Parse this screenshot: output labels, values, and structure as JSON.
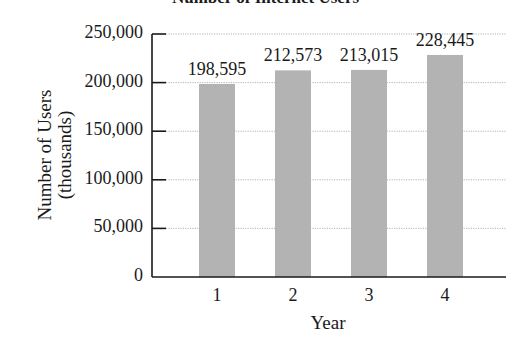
{
  "chart_data": {
    "type": "bar",
    "title": "Number of Internet Users",
    "xlabel": "Year",
    "ylabel": "Number of Users (thousands)",
    "ylabel_lines": [
      "Number of Users",
      "(thousands)"
    ],
    "categories": [
      "1",
      "2",
      "3",
      "4"
    ],
    "values": [
      198595,
      212573,
      213015,
      228445
    ],
    "value_labels": [
      "198,595",
      "212,573",
      "213,015",
      "228,445"
    ],
    "yticks": [
      0,
      50000,
      100000,
      150000,
      200000,
      250000
    ],
    "ytick_labels": [
      "0",
      "50,000",
      "100,000",
      "150,000",
      "200,000",
      "250,000"
    ],
    "ylim": [
      0,
      250000
    ],
    "grid": true,
    "legend": null,
    "colors": {
      "bar": "#b3b3b3",
      "axis": "#1a1a1a",
      "grid": "#a0a0a0"
    }
  }
}
